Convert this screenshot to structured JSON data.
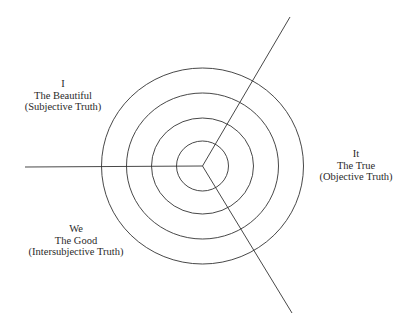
{
  "diagram": {
    "type": "concentric-circles-with-three-axes",
    "colors": {
      "background": "#ffffff",
      "stroke": "#333333",
      "text": "#2a2a2a"
    },
    "center": {
      "x": 202.5,
      "y": 166
    },
    "rings": [
      {
        "rx": 26,
        "ry": 25
      },
      {
        "rx": 51,
        "ry": 48
      },
      {
        "rx": 76,
        "ry": 73
      },
      {
        "rx": 101,
        "ry": 98
      }
    ],
    "axes": [
      {
        "name": "left-axis",
        "x2": 25,
        "y2": 167
      },
      {
        "name": "upper-right-axis",
        "x2": 290,
        "y2": 17
      },
      {
        "name": "lower-right-axis",
        "x2": 292,
        "y2": 313
      }
    ]
  },
  "quadrants": {
    "i": {
      "pronoun": "I",
      "value": "The Beautiful",
      "truth": "(Subjective Truth)"
    },
    "it": {
      "pronoun": "It",
      "value": "The True",
      "truth": "(Objective Truth)"
    },
    "we": {
      "pronoun": "We",
      "value": "The Good",
      "truth": "(Intersubjective Truth)"
    }
  }
}
